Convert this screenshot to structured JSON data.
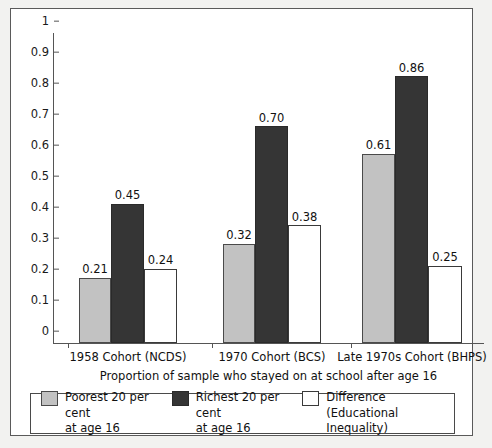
{
  "chart_data": {
    "type": "bar",
    "title": "",
    "xlabel": "Proportion of sample who stayed on at school after age 16",
    "ylabel": "",
    "ylim": [
      0,
      1
    ],
    "grid": false,
    "legend_position": "bottom",
    "categories": [
      "1958 Cohort (NCDS)",
      "1970 Cohort (BCS)",
      "Late 1970s Cohort (BHPS)"
    ],
    "y_ticks": [
      "0",
      "0.1",
      "0.2",
      "0.3",
      "0.4",
      "0.5",
      "0.6",
      "0.7",
      "0.8",
      "0.9",
      "1"
    ],
    "series": [
      {
        "name": "Poorest 20 per cent at age 16",
        "key": "poorest",
        "color": "#c2c2c2",
        "values": [
          0.21,
          0.32,
          0.61
        ],
        "labels": [
          "0.21",
          "0.32",
          "0.61"
        ]
      },
      {
        "name": "Richest 20 per cent at age 16",
        "key": "richest",
        "color": "#353535",
        "values": [
          0.45,
          0.7,
          0.86
        ],
        "labels": [
          "0.45",
          "0.70",
          "0.86"
        ]
      },
      {
        "name": "Difference (Educational Inequality)",
        "key": "difference",
        "color": "#ffffff",
        "values": [
          0.24,
          0.38,
          0.25
        ],
        "labels": [
          "0.24",
          "0.38",
          "0.25"
        ]
      }
    ]
  },
  "legend": {
    "items": [
      {
        "label": "Poorest 20 per cent\nat age 16",
        "swatch": "poorest"
      },
      {
        "label": "Richest 20 per cent\nat age 16",
        "swatch": "richest"
      },
      {
        "label": "Difference\n(Educational Inequality)",
        "swatch": "difference"
      }
    ]
  },
  "axis": {
    "x_title": "Proportion of sample who stayed on at school after age 16"
  }
}
